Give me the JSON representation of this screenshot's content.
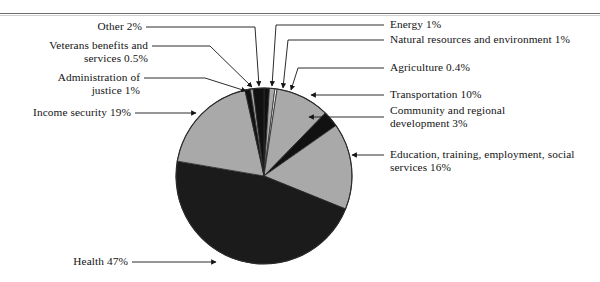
{
  "figure": {
    "background": "#ffffff",
    "rule_color": "#6f6f6f",
    "center": {
      "x": 264,
      "y": 176
    },
    "radius": 88
  },
  "palette": {
    "light_gray": "#a9a9a9",
    "mid_gray": "#8d8d8d",
    "black": "#111111",
    "near_black": "#1b1b1b",
    "outline": "#2b2b2b",
    "white": "#ffffff"
  },
  "chart_data": {
    "type": "pie",
    "title": "",
    "units": "percent of outlays",
    "start_angle_deg": 0,
    "direction": "clockwise",
    "legend": "none (leader-line callouts)",
    "total": 100,
    "categories": [
      "Energy",
      "Natural resources and environment",
      "Agriculture",
      "Transportation",
      "Community and regional development",
      "Education, training, employment, social services",
      "Health",
      "Income security",
      "Administration of justice",
      "Veterans benefits and services",
      "Other"
    ],
    "values": [
      1,
      1,
      0.4,
      10,
      3,
      16,
      47,
      19,
      1,
      0.5,
      2
    ],
    "colors": [
      "#111111",
      "#a9a9a9",
      "#ffffff",
      "#a9a9a9",
      "#111111",
      "#a9a9a9",
      "#1b1b1b",
      "#a9a9a9",
      "#111111",
      "#a9a9a9",
      "#111111"
    ]
  },
  "labels": {
    "other": {
      "text": "Other 2%"
    },
    "veterans": {
      "text": "Veterans benefits and\nservices 0.5%"
    },
    "justice": {
      "text": "Administration of\njustice 1%"
    },
    "income": {
      "text": "Income security 19%"
    },
    "health": {
      "text": "Health 47%"
    },
    "energy": {
      "text": "Energy 1%"
    },
    "natural": {
      "text": "Natural resources and environment 1%"
    },
    "agriculture": {
      "text": "Agriculture 0.4%"
    },
    "transport": {
      "text": "Transportation 10%"
    },
    "community": {
      "text": "Community and regional\ndevelopment 3%"
    },
    "education": {
      "text": "Education, training, employment, social\nservices 16%"
    }
  }
}
